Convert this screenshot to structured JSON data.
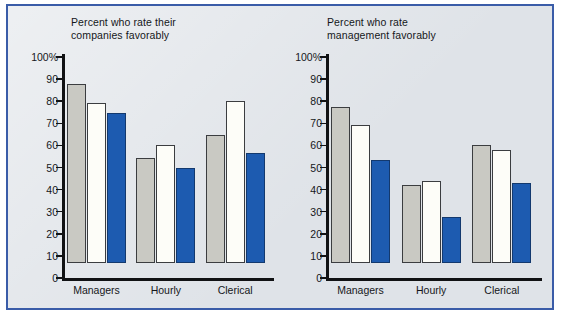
{
  "figure": {
    "background_color": "#dfe3e8",
    "border_color": "#3a5ca8"
  },
  "legend": {
    "position": "top-right",
    "items": [
      {
        "label": "1970–1974",
        "color": "#c9c9c3",
        "name": "series-1970-1974"
      },
      {
        "label": "1975–1979",
        "color": "#fdfdf8",
        "name": "series-1975-1979"
      },
      {
        "label": "1980–1984",
        "color": "#1d5bb0",
        "name": "series-1980-1984"
      }
    ]
  },
  "axis": {
    "tick_labels": [
      "100%",
      "90",
      "80",
      "70",
      "60",
      "50",
      "40",
      "30",
      "20",
      "10",
      "0"
    ],
    "tick_values": [
      100,
      90,
      80,
      70,
      60,
      50,
      40,
      30,
      20,
      10,
      0
    ]
  },
  "chart_data": [
    {
      "type": "bar",
      "id": "companies",
      "title": "Percent who rate their\ncompanies favorably",
      "xlabel": "",
      "ylabel": "",
      "ylim": [
        0,
        100
      ],
      "grid": false,
      "legend_position": "shared-top-right",
      "categories": [
        "Managers",
        "Hourly",
        "Clerical"
      ],
      "series": [
        {
          "name": "1970–1974",
          "color": "#c9c9c3",
          "values": [
            81,
            47.5,
            58
          ]
        },
        {
          "name": "1975–1979",
          "color": "#fdfdf8",
          "values": [
            72.5,
            53.5,
            73.5
          ]
        },
        {
          "name": "1980–1984",
          "color": "#1d5bb0",
          "values": [
            68,
            43,
            50
          ]
        }
      ]
    },
    {
      "type": "bar",
      "id": "management",
      "title": "Percent who rate\nmanagement favorably",
      "xlabel": "",
      "ylabel": "",
      "ylim": [
        0,
        100
      ],
      "grid": false,
      "legend_position": "top-right",
      "categories": [
        "Managers",
        "Hourly",
        "Clerical"
      ],
      "series": [
        {
          "name": "1970–1974",
          "color": "#c9c9c3",
          "values": [
            70.5,
            35.5,
            53.5
          ]
        },
        {
          "name": "1975–1979",
          "color": "#fdfdf8",
          "values": [
            62.5,
            37,
            51
          ]
        },
        {
          "name": "1980–1984",
          "color": "#1d5bb0",
          "values": [
            46.5,
            21,
            36
          ]
        }
      ]
    }
  ]
}
